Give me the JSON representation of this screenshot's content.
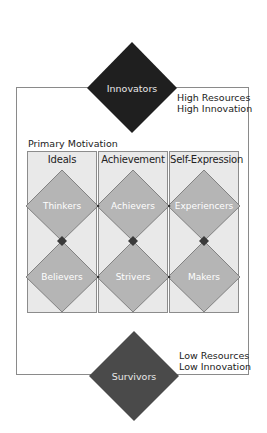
{
  "top": {
    "segment": "Innovators",
    "label_line1": "High Resources",
    "label_line2": "High Innovation",
    "color": "#1f1f1f"
  },
  "bottom": {
    "segment": "Survivors",
    "label_line1": "Low Resources",
    "label_line2": "Low Innovation",
    "color": "#4a4a4a"
  },
  "primary_motivation_label": "Primary Motivation",
  "columns": [
    {
      "title": "Ideals",
      "upper": "Thinkers",
      "lower": "Believers"
    },
    {
      "title": "Achievement",
      "upper": "Achievers",
      "lower": "Strivers"
    },
    {
      "title": "Self-Expression",
      "upper": "Experiencers",
      "lower": "Makers"
    }
  ],
  "colors": {
    "column_bg": "#e9e9e9",
    "segment_diamond": "#b5b5b5",
    "connector_diamond": "#3a3a3a",
    "border": "#8c8c8c"
  }
}
